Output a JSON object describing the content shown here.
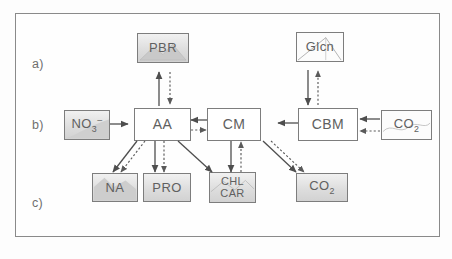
{
  "figure": {
    "frame_color": "#8a8a8a",
    "row_labels": [
      {
        "id": "a",
        "text": "a)"
      },
      {
        "id": "b",
        "text": "b)"
      },
      {
        "id": "c",
        "text": "c)"
      }
    ]
  },
  "nodes": {
    "pbr": {
      "label": "PBR",
      "row": "a",
      "style": "shaded"
    },
    "glc": {
      "label": "Glcn",
      "row": "a",
      "style": "light"
    },
    "no3": {
      "label": "NO3-",
      "row": "b",
      "style": "shaded"
    },
    "aa": {
      "label": "AA",
      "row": "b",
      "style": "plain"
    },
    "cm": {
      "label": "CM",
      "row": "b",
      "style": "plain"
    },
    "cbm": {
      "label": "CBM",
      "row": "b",
      "style": "plain"
    },
    "co2t": {
      "label": "CO2",
      "row": "b",
      "style": "light"
    },
    "na": {
      "label": "NA",
      "row": "c",
      "style": "shaded"
    },
    "pro": {
      "label": "PRO",
      "row": "c",
      "style": "shaded"
    },
    "chl": {
      "label_line1": "CHL",
      "label_line2": "CAR",
      "row": "c",
      "style": "shaded"
    },
    "co2b": {
      "label": "CO2",
      "row": "c",
      "style": "shaded"
    }
  },
  "edges": [
    {
      "from": "aa",
      "to": "pbr",
      "style": "solid",
      "direction": "up"
    },
    {
      "from": "pbr",
      "to": "aa",
      "style": "dotted",
      "direction": "down"
    },
    {
      "from": "cbm",
      "to": "glc",
      "style": "dotted",
      "direction": "up"
    },
    {
      "from": "glc",
      "to": "cbm",
      "style": "solid",
      "direction": "down"
    },
    {
      "from": "no3",
      "to": "aa",
      "style": "solid",
      "direction": "right"
    },
    {
      "from": "cm",
      "to": "aa",
      "style": "solid",
      "direction": "left"
    },
    {
      "from": "aa",
      "to": "cm",
      "style": "dotted",
      "direction": "right"
    },
    {
      "from": "cbm",
      "to": "cm",
      "style": "solid",
      "direction": "left"
    },
    {
      "from": "co2t",
      "to": "cbm",
      "style": "solid",
      "direction": "left"
    },
    {
      "from": "co2t",
      "to": "cbm",
      "style": "dotted",
      "direction": "left"
    },
    {
      "from": "aa",
      "to": "na",
      "style": "solid",
      "direction": "down-left"
    },
    {
      "from": "aa",
      "to": "na",
      "style": "dotted",
      "direction": "down-left"
    },
    {
      "from": "aa",
      "to": "pro",
      "style": "solid",
      "direction": "down"
    },
    {
      "from": "aa",
      "to": "pro",
      "style": "dotted",
      "direction": "down"
    },
    {
      "from": "aa",
      "to": "chl",
      "style": "solid",
      "direction": "down-right"
    },
    {
      "from": "cm",
      "to": "chl",
      "style": "solid",
      "direction": "down"
    },
    {
      "from": "chl",
      "to": "cm",
      "style": "dotted",
      "direction": "up"
    },
    {
      "from": "cm",
      "to": "co2b",
      "style": "solid",
      "direction": "down-right"
    },
    {
      "from": "cm",
      "to": "co2b",
      "style": "dotted",
      "direction": "down-right"
    }
  ]
}
